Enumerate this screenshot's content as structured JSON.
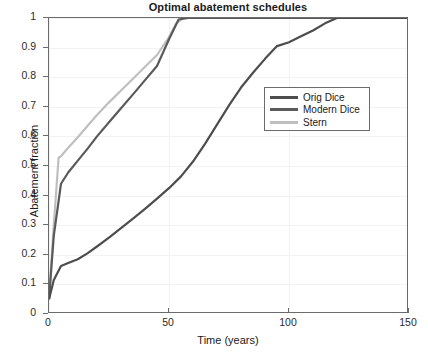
{
  "chart_data": {
    "type": "line",
    "title": "Optimal abatement schedules",
    "xlabel": "Time (years)",
    "ylabel": "Abatement fraction",
    "xlim": [
      0,
      150
    ],
    "ylim": [
      0,
      1
    ],
    "grid": true,
    "legend_position": "center-right",
    "xticks": [
      0,
      50,
      100,
      150
    ],
    "xtick_labels": [
      "0",
      "50",
      "100",
      "150"
    ],
    "yticks": [
      0,
      0.1,
      0.2,
      0.3,
      0.4,
      0.5,
      0.6,
      0.7,
      0.8,
      0.9,
      1
    ],
    "ytick_labels": [
      "0",
      "0.1",
      "0.2",
      "0.3",
      "0.4",
      "0.5",
      "0.6",
      "0.7",
      "0.8",
      "0.9",
      "1"
    ],
    "series": [
      {
        "name": "Orig Dice",
        "color": "#4d4d4d",
        "x": [
          0,
          2,
          5,
          8,
          12,
          16,
          20,
          25,
          30,
          35,
          40,
          45,
          50,
          55,
          60,
          65,
          70,
          75,
          80,
          85,
          90,
          95,
          100,
          105,
          110,
          115,
          120,
          125,
          130,
          140,
          150
        ],
        "y": [
          0.05,
          0.115,
          0.162,
          0.172,
          0.185,
          0.205,
          0.228,
          0.258,
          0.29,
          0.322,
          0.355,
          0.39,
          0.425,
          0.465,
          0.515,
          0.575,
          0.64,
          0.705,
          0.765,
          0.815,
          0.862,
          0.905,
          0.918,
          0.938,
          0.958,
          0.982,
          1.0,
          1.0,
          1.0,
          1.0,
          1.0
        ]
      },
      {
        "name": "Modern Dice",
        "color": "#5a5a5a",
        "x": [
          0,
          2,
          5,
          8,
          12,
          16,
          20,
          25,
          30,
          35,
          40,
          45,
          50,
          54,
          58,
          70,
          90,
          110,
          130,
          150
        ],
        "y": [
          0.05,
          0.265,
          0.44,
          0.478,
          0.518,
          0.558,
          0.6,
          0.648,
          0.695,
          0.742,
          0.79,
          0.838,
          0.928,
          0.995,
          1.0,
          1.0,
          1.0,
          1.0,
          1.0,
          1.0
        ]
      },
      {
        "name": "Stern",
        "color": "#bfbfbf",
        "x": [
          0,
          2,
          4,
          5,
          8,
          12,
          16,
          20,
          25,
          30,
          35,
          40,
          45,
          50,
          53,
          56,
          70,
          90,
          110,
          130,
          150
        ],
        "y": [
          0.05,
          0.3,
          0.528,
          0.533,
          0.562,
          0.597,
          0.635,
          0.672,
          0.715,
          0.755,
          0.795,
          0.835,
          0.875,
          0.935,
          0.982,
          1.0,
          1.0,
          1.0,
          1.0,
          1.0,
          1.0
        ]
      }
    ]
  },
  "legend": {
    "entries": [
      {
        "label": "Orig Dice"
      },
      {
        "label": "Modern Dice"
      },
      {
        "label": "Stern"
      }
    ]
  }
}
